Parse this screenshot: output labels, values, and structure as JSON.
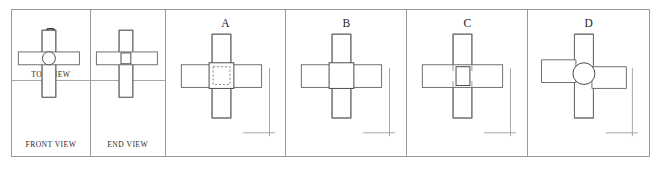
{
  "puzzle": {
    "type": "orthographic-projection-missing-view",
    "question_mark": "?",
    "given_views": [
      {
        "id": "front",
        "label": "FRONT VIEW",
        "shape": "cross-with-center-circle"
      },
      {
        "id": "end",
        "label": "END VIEW",
        "shape": "cross-with-center-square"
      }
    ],
    "missing_view": {
      "id": "top",
      "label": "TOP VIEW",
      "placeholder": "?"
    }
  },
  "options": [
    {
      "letter": "A",
      "name": "option-a",
      "description": "cross with solid center square containing hidden dashed square",
      "center_feature": "square-with-dashed-hidden-detail"
    },
    {
      "letter": "B",
      "name": "option-b",
      "description": "cross with plain solid center square",
      "center_feature": "plain-square"
    },
    {
      "letter": "C",
      "name": "option-c",
      "description": "cross with narrow center square and visible bar edges",
      "center_feature": "narrow-square-with-edges"
    },
    {
      "letter": "D",
      "name": "option-d",
      "description": "cross with center circle and offset horizontal arm",
      "center_feature": "circle-with-offset-arm"
    }
  ],
  "colors": {
    "frame": "#9a9a9a",
    "line": "#6f6f6f",
    "line_dark": "#4a4a4a",
    "line_light": "#9d9d9d",
    "hidden_dashed": "#8c8c8c",
    "text": "#1d1d1d",
    "background": "#ffffff"
  }
}
